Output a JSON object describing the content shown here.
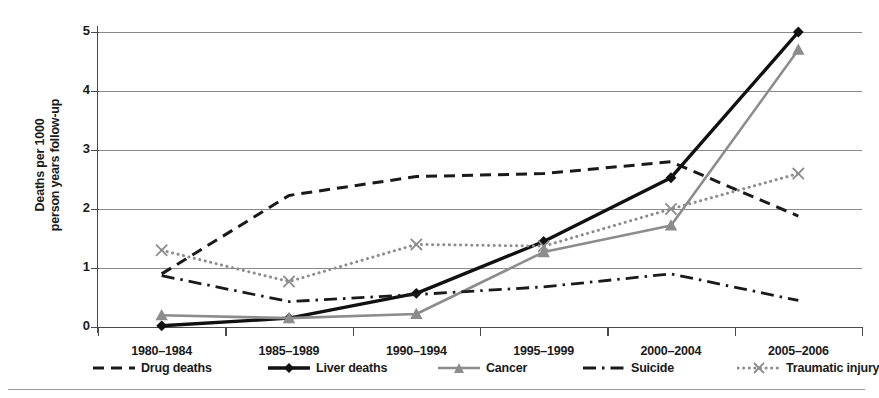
{
  "chart_data": {
    "type": "line",
    "title": "",
    "xlabel": "",
    "ylabel": "Deaths per 1000 person years follow-up",
    "ylabel_line1": "Deaths per 1000",
    "ylabel_line2": "person years follow-up",
    "categories": [
      "1980–1984",
      "1985–1989",
      "1990–1994",
      "1995–1999",
      "2000–2004",
      "2005–2006"
    ],
    "ylim": [
      0,
      5
    ],
    "yticks": [
      0,
      1,
      2,
      3,
      4,
      5
    ],
    "ytick_labels": [
      "0",
      "1",
      "2",
      "3",
      "4",
      "5"
    ],
    "grid": true,
    "legend_position": "bottom",
    "series": [
      {
        "name": "Drug deaths",
        "values": [
          0.9,
          2.23,
          2.55,
          2.6,
          2.8,
          1.88
        ],
        "color": "#1a1a1a",
        "style": "dashed",
        "marker": "none"
      },
      {
        "name": "Liver deaths",
        "values": [
          0.02,
          0.15,
          0.57,
          1.45,
          2.53,
          5.0
        ],
        "color": "#111111",
        "style": "solid",
        "marker": "diamond"
      },
      {
        "name": "Cancer",
        "values": [
          0.2,
          0.15,
          0.22,
          1.27,
          1.72,
          4.7
        ],
        "color": "#8c8c8c",
        "style": "solid",
        "marker": "triangle"
      },
      {
        "name": "Suicide",
        "values": [
          0.87,
          0.43,
          0.55,
          0.68,
          0.9,
          0.45
        ],
        "color": "#1a1a1a",
        "style": "dashdot",
        "marker": "none"
      },
      {
        "name": "Traumatic injury",
        "values": [
          1.3,
          0.77,
          1.4,
          1.37,
          2.0,
          2.6
        ],
        "color": "#8c8c8c",
        "style": "dotted",
        "marker": "cross"
      }
    ]
  }
}
